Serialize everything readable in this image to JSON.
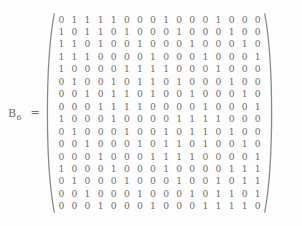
{
  "equation": {
    "symbol": "B",
    "subscript": "6",
    "equals": "=",
    "bracket_left": "left-paren",
    "bracket_right": "right-paren"
  },
  "chart_data": {
    "type": "table",
    "xlabel": "",
    "ylabel": "",
    "rows": 16,
    "cols": 16,
    "categories": [
      "c1",
      "c2",
      "c3",
      "c4",
      "c5",
      "c6",
      "c7",
      "c8",
      "c9",
      "c10",
      "c11",
      "c12",
      "c13",
      "c14",
      "c15",
      "c16"
    ],
    "values": [
      [
        0,
        1,
        1,
        1,
        1,
        0,
        0,
        0,
        1,
        0,
        0,
        0,
        1,
        0,
        0,
        0
      ],
      [
        1,
        0,
        1,
        1,
        0,
        1,
        0,
        0,
        0,
        1,
        0,
        0,
        0,
        1,
        0,
        0
      ],
      [
        1,
        1,
        0,
        1,
        0,
        0,
        1,
        0,
        0,
        0,
        1,
        0,
        0,
        0,
        1,
        0
      ],
      [
        1,
        1,
        1,
        0,
        0,
        0,
        0,
        1,
        0,
        0,
        0,
        1,
        0,
        0,
        0,
        1
      ],
      [
        1,
        0,
        0,
        0,
        0,
        1,
        1,
        1,
        1,
        0,
        0,
        0,
        1,
        0,
        0,
        0
      ],
      [
        0,
        1,
        0,
        0,
        1,
        0,
        1,
        1,
        0,
        1,
        0,
        0,
        0,
        1,
        0,
        0
      ],
      [
        0,
        0,
        1,
        0,
        1,
        1,
        0,
        1,
        0,
        0,
        1,
        0,
        0,
        0,
        1,
        0
      ],
      [
        0,
        0,
        0,
        1,
        1,
        1,
        1,
        0,
        0,
        0,
        0,
        1,
        0,
        0,
        0,
        1
      ],
      [
        1,
        0,
        0,
        0,
        1,
        0,
        0,
        0,
        0,
        1,
        1,
        1,
        1,
        0,
        0,
        0
      ],
      [
        0,
        1,
        0,
        0,
        0,
        1,
        0,
        0,
        1,
        0,
        1,
        1,
        0,
        1,
        0,
        0
      ],
      [
        0,
        0,
        1,
        0,
        0,
        0,
        1,
        0,
        1,
        1,
        0,
        1,
        0,
        0,
        1,
        0
      ],
      [
        0,
        0,
        0,
        1,
        0,
        0,
        0,
        1,
        1,
        1,
        1,
        0,
        0,
        0,
        0,
        1
      ],
      [
        1,
        0,
        0,
        0,
        1,
        0,
        0,
        0,
        1,
        0,
        0,
        0,
        0,
        1,
        1,
        1
      ],
      [
        0,
        1,
        0,
        0,
        0,
        1,
        0,
        0,
        0,
        1,
        0,
        0,
        1,
        0,
        1,
        1
      ],
      [
        0,
        0,
        1,
        0,
        0,
        0,
        1,
        0,
        0,
        0,
        1,
        0,
        1,
        1,
        0,
        1
      ],
      [
        0,
        0,
        0,
        1,
        0,
        0,
        0,
        1,
        0,
        0,
        0,
        1,
        1,
        1,
        1,
        0
      ]
    ]
  },
  "colors": {
    "text": "#707070",
    "background": "#fdfdfd",
    "bracket": "#8a8a8a"
  }
}
